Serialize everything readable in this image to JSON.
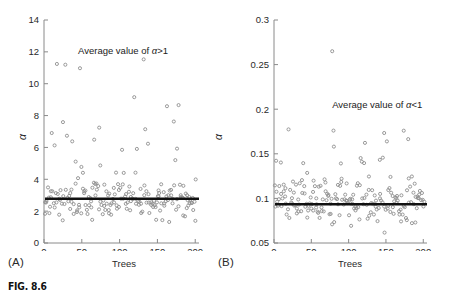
{
  "figure": {
    "caption": "FIG. 8.6",
    "background": "#ffffff",
    "axis_color": "#8a8a8a",
    "marker_color": "#8e8e8e",
    "mean_line_color": "#111111"
  },
  "chart_data": [
    {
      "type": "scatter",
      "panel": "A",
      "panel_label": "(A)",
      "title": "",
      "xlabel": "Trees",
      "ylabel": "α",
      "xlim": [
        0,
        205
      ],
      "ylim": [
        0,
        14
      ],
      "xticks": [
        0,
        50,
        100,
        150,
        200
      ],
      "xtick_labels": [
        "0",
        "50",
        "100",
        "150",
        "200"
      ],
      "yticks": [
        0,
        2,
        4,
        6,
        8,
        10,
        12,
        14
      ],
      "ytick_labels": [
        "0",
        "2",
        "4",
        "6",
        "8",
        "10",
        "12",
        "14"
      ],
      "grid": false,
      "legend": "none",
      "annotation": {
        "text_before": "Average value of ",
        "alpha": "α",
        "text_after": ">1",
        "x": 45,
        "y": 12.05
      },
      "mean_line": {
        "value": 2.78,
        "label": "Average value of α>1",
        "linewidth": 2.6
      },
      "n_points": 205,
      "marker": "open-circle",
      "marker_size": 3.1,
      "scatter_model": {
        "seed": 8601,
        "base_low": 1.05,
        "base_high": 4.35,
        "spike_probability": 0.14,
        "spike_low": 4.4,
        "spike_high": 12.3
      }
    },
    {
      "type": "scatter",
      "panel": "B",
      "panel_label": "(B)",
      "title": "",
      "xlabel": "Trees",
      "ylabel": "α",
      "xlim": [
        0,
        205
      ],
      "ylim": [
        0.05,
        0.3
      ],
      "xticks": [
        0,
        50,
        100,
        150,
        200
      ],
      "xtick_labels": [
        "0",
        "50",
        "100",
        "150",
        "200"
      ],
      "yticks": [
        0.05,
        0.1,
        0.15,
        0.2,
        0.25,
        0.3
      ],
      "ytick_labels": [
        "0.05",
        "0.1",
        "0.15",
        "0.2",
        "0.25",
        "0.3"
      ],
      "grid": false,
      "legend": "none",
      "annotation": {
        "text_before": "Average value of ",
        "alpha": "α",
        "text_after": "<1",
        "x": 78,
        "y": 0.205
      },
      "mean_line": {
        "value": 0.0935,
        "label": "Average value of α<1",
        "linewidth": 2.6
      },
      "n_points": 205,
      "marker": "open-circle",
      "marker_size": 3.1,
      "scatter_model": {
        "seed": 4417,
        "base_low": 0.055,
        "base_high": 0.137,
        "spike_probability": 0.08,
        "spike_low": 0.139,
        "spike_high": 0.178,
        "outlier": {
          "x": 78,
          "y": 0.265
        }
      }
    }
  ]
}
